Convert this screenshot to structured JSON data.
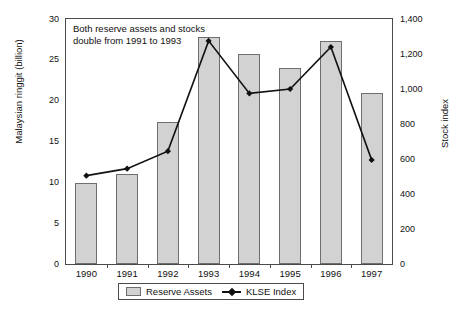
{
  "chart_data": {
    "type": "bar",
    "title": "",
    "categories": [
      "1990",
      "1991",
      "1992",
      "1993",
      "1994",
      "1995",
      "1996",
      "1997"
    ],
    "series": [
      {
        "name": "Reserve Assets",
        "type": "bar",
        "axis": "left",
        "values": [
          9.9,
          11.0,
          17.4,
          27.8,
          25.7,
          24.0,
          27.3,
          21.0
        ]
      },
      {
        "name": "KLSE Index",
        "type": "line",
        "axis": "right",
        "values": [
          505,
          545,
          645,
          1275,
          975,
          1000,
          1240,
          595
        ]
      }
    ],
    "xlabel": "",
    "ylabel": "Malaysian ringgit (billion)",
    "y2label": "Stock index",
    "ylim": [
      0,
      30
    ],
    "y2lim": [
      0,
      1400
    ],
    "yticks": [
      "0",
      "5",
      "10",
      "15",
      "20",
      "25",
      "30"
    ],
    "y2ticks": [
      "0",
      "200",
      "400",
      "600",
      "800",
      "1,000",
      "1,200",
      "1,400"
    ],
    "grid": false,
    "legend_position": "bottom",
    "annotations": [
      "Both reserve assets and stocks\ndouble from 1991 to 1993"
    ],
    "colors": {
      "bar_fill": "#d2d2d2",
      "bar_border": "#6e6e6e",
      "line": "#111111",
      "axis": "#4a4a4a",
      "background": "#ffffff"
    }
  },
  "legend": {
    "items": [
      {
        "label": "Reserve Assets"
      },
      {
        "label": "KLSE Index"
      }
    ]
  }
}
